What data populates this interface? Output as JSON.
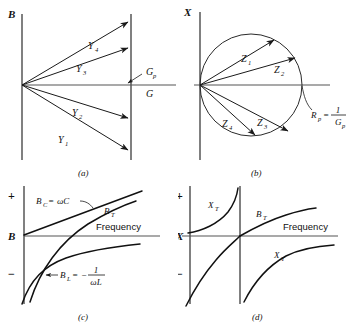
{
  "figure": {
    "background": "#ffffff",
    "ink_color": "#111111",
    "axis_color": "#4a4a4a"
  },
  "panels": [
    {
      "id": "a",
      "caption": "(a)",
      "type": "vector-diagram",
      "description": "Admittance vectors terminating on a line of constant conductance",
      "axes": {
        "vertical_label": "B",
        "horizontal_label": "G",
        "constant_line_label": "G_p",
        "constant_line_label_plain": "Gp"
      },
      "vectors": [
        {
          "name": "Y_1",
          "base": "Y",
          "sub": "1",
          "quadrant": "lower",
          "angle_deg": -38
        },
        {
          "name": "Y_2",
          "base": "Y",
          "sub": "2",
          "quadrant": "lower",
          "angle_deg": -17
        },
        {
          "name": "Y_3",
          "base": "Y",
          "sub": "3",
          "quadrant": "upper",
          "angle_deg": 19
        },
        {
          "name": "Y_4",
          "base": "Y",
          "sub": "4",
          "quadrant": "upper",
          "angle_deg": 39
        }
      ]
    },
    {
      "id": "b",
      "caption": "(b)",
      "type": "vector-diagram-circle",
      "description": "Impedance vectors terminating on a circle, the inversion of the constant-conductance line",
      "axes": {
        "vertical_label": "X",
        "horizontal_label": ""
      },
      "circle_label": {
        "lhs": "R_p",
        "lhs_base": "R",
        "lhs_sub": "p",
        "equals": "=",
        "numerator": "1",
        "denominator": "G_p",
        "denominator_base": "G",
        "denominator_sub": "p",
        "plain": "Rp = 1 / Gp"
      },
      "vectors": [
        {
          "name": "Z_1",
          "base": "Z",
          "sub": "1",
          "quadrant": "upper",
          "angle_deg": 38
        },
        {
          "name": "Z_2",
          "base": "Z",
          "sub": "2",
          "quadrant": "upper",
          "angle_deg": 17
        },
        {
          "name": "Z_3",
          "base": "Z",
          "sub": "3",
          "quadrant": "lower",
          "angle_deg": -32
        },
        {
          "name": "Z_4",
          "base": "Z",
          "sub": "4",
          "quadrant": "lower",
          "angle_deg": -55
        }
      ]
    },
    {
      "id": "c",
      "caption": "(c)",
      "type": "frequency-plot",
      "description": "Susceptance components versus frequency for a parallel circuit",
      "axes": {
        "vertical_label": "B",
        "horizontal_label": "Frequency",
        "plus_sign": "+",
        "minus_sign": "−"
      },
      "curves": [
        {
          "name": "B_C",
          "base": "B",
          "sub": "C",
          "equals": "=",
          "expression": "ωC",
          "plain": "BC = ωC",
          "shape": "straight-rising",
          "has_leader": true
        },
        {
          "name": "B_T",
          "base": "B",
          "sub": "T",
          "plain": "BT",
          "shape": "total-rising",
          "has_leader": false
        },
        {
          "name": "B_L",
          "base": "B",
          "sub": "L",
          "equals": "=",
          "expression_sign": "−",
          "numerator": "1",
          "denominator": "ωL",
          "plain": "BL = −1/ωL",
          "shape": "negative-hyperbolic",
          "has_leader": true
        }
      ]
    },
    {
      "id": "d",
      "caption": "(d)",
      "type": "frequency-plot",
      "description": "Total reactance versus frequency showing a pole at antiresonance, with total susceptance",
      "axes": {
        "vertical_label": "X",
        "horizontal_label": "Frequency",
        "plus_sign": "+",
        "minus_sign": "−"
      },
      "curves": [
        {
          "name": "X_T",
          "base": "X",
          "sub": "T",
          "plain": "XT",
          "shape": "pole-left-branch",
          "has_leader": false
        },
        {
          "name": "B_T",
          "base": "B",
          "sub": "T",
          "plain": "BT",
          "shape": "total-rising",
          "has_leader": false
        },
        {
          "name": "X_T",
          "base": "X",
          "sub": "T",
          "plain": "XT",
          "shape": "pole-right-branch",
          "has_leader": false
        }
      ],
      "asymptote": {
        "present": true,
        "description": "vertical resonance asymptote"
      }
    }
  ]
}
